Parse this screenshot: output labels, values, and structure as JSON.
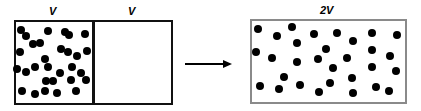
{
  "labels": {
    "left_half": "V",
    "right_half": "V",
    "expanded": "2V"
  },
  "colors": {
    "dot": "#000000",
    "left_border": "#111111",
    "right_border": "#8a8a8a"
  },
  "left_dots": [
    [
      21,
      30
    ],
    [
      26,
      36
    ],
    [
      48,
      31
    ],
    [
      65,
      32
    ],
    [
      69,
      35
    ],
    [
      85,
      34
    ],
    [
      33,
      44
    ],
    [
      40,
      43
    ],
    [
      20,
      52
    ],
    [
      61,
      49
    ],
    [
      68,
      52
    ],
    [
      77,
      56
    ],
    [
      87,
      51
    ],
    [
      45,
      59
    ],
    [
      17,
      69
    ],
    [
      26,
      72
    ],
    [
      35,
      67
    ],
    [
      48,
      67
    ],
    [
      60,
      73
    ],
    [
      72,
      67
    ],
    [
      81,
      73
    ],
    [
      46,
      81
    ],
    [
      53,
      81
    ],
    [
      71,
      80
    ],
    [
      86,
      80
    ],
    [
      22,
      91
    ],
    [
      35,
      94
    ],
    [
      45,
      91
    ],
    [
      57,
      93
    ],
    [
      76,
      91
    ]
  ],
  "right_dots": [
    [
      258,
      29
    ],
    [
      277,
      36
    ],
    [
      292,
      27
    ],
    [
      314,
      34
    ],
    [
      337,
      33
    ],
    [
      353,
      41
    ],
    [
      372,
      33
    ],
    [
      397,
      35
    ],
    [
      297,
      43
    ],
    [
      256,
      52
    ],
    [
      272,
      58
    ],
    [
      297,
      62
    ],
    [
      326,
      49
    ],
    [
      318,
      59
    ],
    [
      347,
      58
    ],
    [
      372,
      50
    ],
    [
      390,
      56
    ],
    [
      333,
      68
    ],
    [
      372,
      67
    ],
    [
      396,
      71
    ],
    [
      284,
      77
    ],
    [
      330,
      83
    ],
    [
      352,
      78
    ],
    [
      260,
      86
    ],
    [
      279,
      89
    ],
    [
      300,
      85
    ],
    [
      319,
      92
    ],
    [
      353,
      93
    ],
    [
      376,
      87
    ],
    [
      389,
      91
    ]
  ]
}
